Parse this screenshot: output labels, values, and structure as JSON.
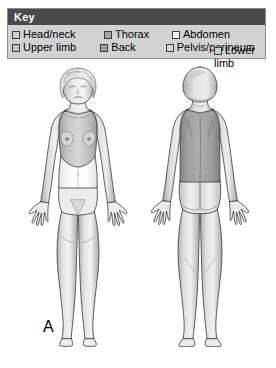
{
  "panel": {
    "name": "anatomical-regions-figure",
    "background_color": "#ffffff"
  },
  "key": {
    "title": "Key",
    "title_bar_color": "#4a4a4a",
    "box_background_color": "#d2d2d2",
    "border_color": "#8d8d8d",
    "items": [
      {
        "label": "Head/neck",
        "swatch_color": "#cfcfcf",
        "swatch_border": "#3c3c3c"
      },
      {
        "label": "Thorax",
        "swatch_color": "#a6a6a6",
        "swatch_border": "#3c3c3c"
      },
      {
        "label": "Abdomen",
        "swatch_color": "#ffffff",
        "swatch_border": "#3c3c3c"
      },
      {
        "label": "Lower limb",
        "swatch_color": "#cfcfcf",
        "swatch_border": "#3c3c3c"
      },
      {
        "label": "Upper limb",
        "swatch_color": "#c2c2c2",
        "swatch_border": "#3c3c3c"
      },
      {
        "label": "Back",
        "swatch_color": "#9a9a9a",
        "swatch_border": "#3c3c3c"
      },
      {
        "label": "Pelvis/perineum",
        "swatch_color": "#d9d9d9",
        "swatch_border": "#3c3c3c"
      }
    ],
    "row_one": [
      {
        "label": "Head/neck",
        "swatch_color": "#cfcfcf"
      },
      {
        "label": "Thorax",
        "swatch_color": "#a6a6a6"
      },
      {
        "label": "Abdomen",
        "swatch_color": "#ffffff"
      }
    ],
    "row_two": [
      {
        "label": "Upper limb",
        "swatch_color": "#c2c2c2"
      },
      {
        "label": "Back",
        "swatch_color": "#9a9a9a"
      },
      {
        "label": "Pelvis/perineum",
        "swatch_color": "#d9d9d9"
      }
    ],
    "lower_limb": {
      "label_line1": "Lower",
      "label_line2": "limb",
      "swatch_color": "#cfcfcf"
    }
  },
  "figures": [
    {
      "id": "A",
      "label": "A",
      "view": "anterior",
      "description": "Anterior (front) view of adult female body showing shaded anatomical regions",
      "regions": {
        "head_neck": "#cfcfcf",
        "thorax": "#b5b5b5",
        "abdomen": "#fdfdfd",
        "upper_limb": "#c9c9c9",
        "pelvis_perineum": "#e2e2e2",
        "lower_limb": "#d4d4d4"
      }
    },
    {
      "id": "B",
      "label": "B",
      "view": "posterior",
      "description": "Posterior (back) view of adult female body showing shaded anatomical regions",
      "regions": {
        "head_neck": "#cfcfcf",
        "back": "#9d9d9d",
        "upper_limb": "#c9c9c9",
        "pelvis_perineum": "#e6e6e6",
        "lower_limb": "#d4d4d4"
      }
    }
  ],
  "colors": {
    "outline": "#3a3a3a",
    "skin_base": "#f0f0f0",
    "shadow": "#b0b0b0",
    "text": "#000000"
  }
}
